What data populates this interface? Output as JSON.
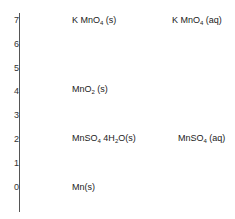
{
  "diagram": {
    "type": "oxidation-state-ladder",
    "axis": {
      "label": "",
      "ticks": [
        "7",
        "6",
        "5",
        "4",
        "3",
        "2",
        "1",
        "0"
      ]
    },
    "levels": [
      {
        "oxidation_state": "7",
        "solid": {
          "base": "K MnO",
          "sub": "4",
          "rest": " (s)"
        },
        "aqueous": {
          "base": "K MnO",
          "sub": "4",
          "rest": " (aq)"
        }
      },
      {
        "oxidation_state": "4",
        "solid": {
          "base": "MnO",
          "sub": "2",
          "rest": " (s)"
        }
      },
      {
        "oxidation_state": "2",
        "solid": {
          "base": "MnSO",
          "sub": "4",
          "mid": " 4H",
          "sub2": "2",
          "rest": "O(s)"
        },
        "aqueous": {
          "base": "MnSO",
          "sub": "4",
          "rest": " (aq)"
        }
      },
      {
        "oxidation_state": "0",
        "solid": {
          "base": "Mn",
          "rest": "(s)"
        }
      }
    ]
  }
}
